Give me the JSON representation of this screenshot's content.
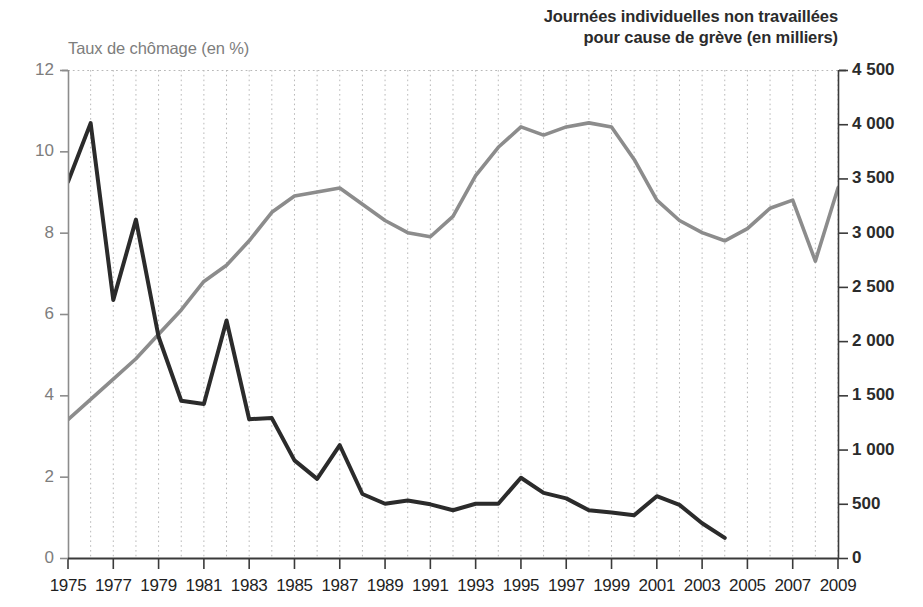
{
  "chart_data": {
    "type": "line",
    "title": "",
    "xlabel": "",
    "x": [
      1975,
      1976,
      1977,
      1978,
      1979,
      1980,
      1981,
      1982,
      1983,
      1984,
      1985,
      1986,
      1987,
      1988,
      1989,
      1990,
      1991,
      1992,
      1993,
      1994,
      1995,
      1996,
      1997,
      1998,
      1999,
      2000,
      2001,
      2002,
      2003,
      2004,
      2005,
      2006,
      2007,
      2008,
      2009
    ],
    "xticks": [
      "1975",
      "1977",
      "1979",
      "1981",
      "1983",
      "1985",
      "1987",
      "1989",
      "1991",
      "1993",
      "1995",
      "1997",
      "1999",
      "2001",
      "2003",
      "2005",
      "2007",
      "2009"
    ],
    "xlim": [
      1975,
      2009
    ],
    "grid": "vertical dotted gridlines at every year",
    "legend_position": "axis titles above each axis (no legend box)",
    "axes": [
      {
        "id": "left",
        "label": "Taux de chômage (en %)",
        "ylim": [
          0,
          12
        ],
        "yticks": [
          "0",
          "2",
          "4",
          "6",
          "8",
          "10",
          "12"
        ],
        "tick_values": [
          0,
          2,
          4,
          6,
          8,
          10,
          12
        ],
        "color": "#8c8c8c",
        "bold": false
      },
      {
        "id": "right",
        "label": "Journées individuelles non travaillées\npour cause de grève (en milliers)",
        "ylim": [
          0,
          4500
        ],
        "yticks": [
          "0",
          "500",
          "1 000",
          "1 500",
          "2 000",
          "2 500",
          "3 000",
          "3 500",
          "4 000",
          "4 500"
        ],
        "tick_values": [
          0,
          500,
          1000,
          1500,
          2000,
          2500,
          3000,
          3500,
          4000,
          4500
        ],
        "color": "#2b2b2b",
        "bold": true
      }
    ],
    "series": [
      {
        "name": "Taux de chômage (en %)",
        "axis": "left",
        "color": "#8c8c8c",
        "unit": "%",
        "values": [
          3.4,
          3.9,
          4.4,
          4.9,
          5.5,
          6.1,
          6.8,
          7.2,
          7.8,
          8.5,
          8.9,
          9.0,
          9.1,
          8.7,
          8.3,
          8.0,
          7.9,
          8.4,
          9.4,
          10.1,
          10.6,
          10.4,
          10.6,
          10.7,
          10.6,
          9.8,
          8.8,
          8.3,
          8.0,
          7.8,
          8.1,
          8.6,
          8.8,
          7.3,
          9.1
        ]
      },
      {
        "name": "Journées individuelles non travaillées pour cause de grève (en milliers)",
        "axis": "right",
        "color": "#2b2b2b",
        "unit": "milliers de journées",
        "values": [
          3470,
          4010,
          2380,
          3120,
          2040,
          1450,
          1420,
          2190,
          1280,
          1290,
          900,
          730,
          1040,
          590,
          500,
          530,
          495,
          440,
          500,
          500,
          740,
          600,
          550,
          440,
          420,
          395,
          570,
          490,
          320,
          185,
          null,
          null,
          null,
          null,
          null
        ]
      }
    ]
  }
}
